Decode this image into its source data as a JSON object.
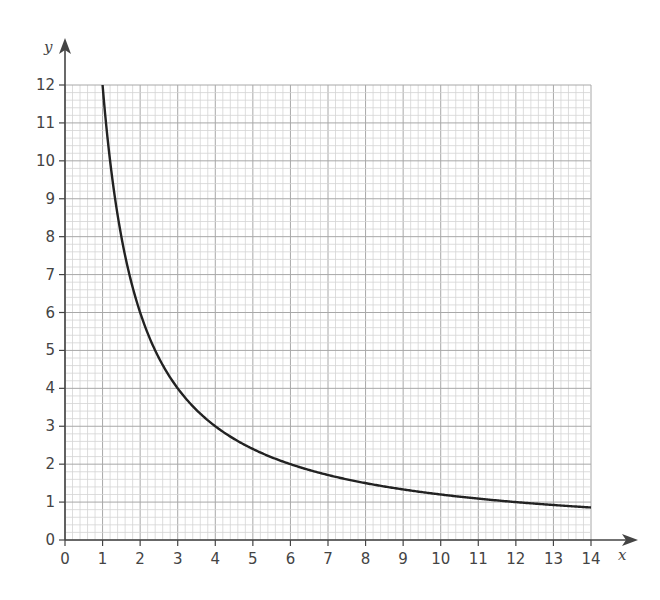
{
  "chart_data": {
    "type": "line",
    "title": "",
    "xlabel": "x",
    "ylabel": "y",
    "xlim": [
      0,
      14
    ],
    "ylim": [
      0,
      12
    ],
    "x_ticks": [
      "0",
      "1",
      "2",
      "3",
      "4",
      "5",
      "6",
      "7",
      "8",
      "9",
      "10",
      "11",
      "12",
      "13",
      "14"
    ],
    "y_ticks": [
      "0",
      "1",
      "2",
      "3",
      "4",
      "5",
      "6",
      "7",
      "8",
      "9",
      "10",
      "11",
      "12"
    ],
    "grid": {
      "on": true,
      "major_step": 1,
      "minor_divisions": 5
    },
    "legend": null,
    "series": [
      {
        "name": "y = 12/x",
        "x": [
          1,
          1.5,
          2,
          2.5,
          3,
          3.5,
          4,
          5,
          6,
          7,
          8,
          9,
          10,
          11,
          12,
          13,
          14
        ],
        "values": [
          12,
          8,
          6,
          4.8,
          4,
          3.43,
          3,
          2.4,
          2,
          1.71,
          1.5,
          1.33,
          1.2,
          1.09,
          1,
          0.92,
          0.86
        ]
      }
    ]
  },
  "colors": {
    "grid_minor": "#d4d4d4",
    "grid_major": "#a8a8a8",
    "axis": "#444444",
    "curve": "#222222"
  }
}
